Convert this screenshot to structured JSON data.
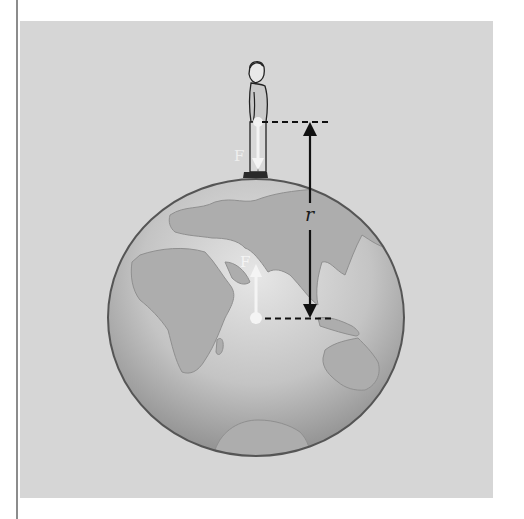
{
  "figure": {
    "labels": {
      "r": "r",
      "force_on_person": "F",
      "force_on_earth": "F"
    },
    "colors": {
      "background_panel": "#d6d6d6",
      "globe_outline": "#5a5a5a",
      "globe_fill_light": "#e2e2e2",
      "globe_fill_dark": "#9a9a9a",
      "continent_fill": "#a9a9a9",
      "arrow_dark": "#111111",
      "arrow_light": "#f4f4f4"
    }
  }
}
